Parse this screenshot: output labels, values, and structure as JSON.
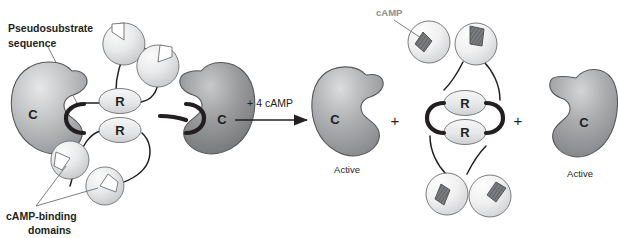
{
  "figure": {
    "width": 618,
    "height": 238
  },
  "annotations": {
    "pseudosubstrate_line1": "Pseudosubstrate",
    "pseudosubstrate_line2": "sequence",
    "camp_binding_line1": "cAMP-binding",
    "camp_binding_line2": "domains",
    "camp_ligand": "cAMP"
  },
  "reaction": {
    "arrow_label": "+ 4 cAMP",
    "plus_1": "+",
    "plus_2": "+"
  },
  "subunits": {
    "catalytic_label": "C",
    "regulatory_label": "R",
    "active_label_left": "Active",
    "active_label_right": "Active"
  },
  "colors": {
    "c_subunit_light": "#c9cacb",
    "c_subunit_dark": "#8a8c8e",
    "c_subunit_mid": "#a7a9ac",
    "r_subunit": "#e8e9ea",
    "domain_empty": "#e3e4e5",
    "domain_bound": "#efefef",
    "camp_ligand_fill": "#6d6e71",
    "outline": "#58595b",
    "ink": "#231f20",
    "leader": "#6f6f6f",
    "background": "#ffffff"
  },
  "structure": {
    "left_complex_name": "inactive-holoenzyme",
    "left_complex_parts": [
      "C subunit",
      "C subunit",
      "R subunit",
      "R subunit",
      "4 empty cAMP-binding domains"
    ],
    "right_products": [
      "free active C subunit",
      "R dimer with 4 cAMP bound",
      "free active C subunit"
    ]
  }
}
